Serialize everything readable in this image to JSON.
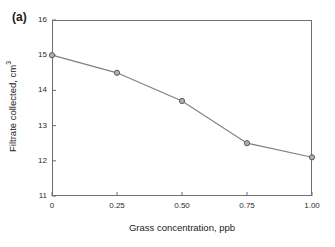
{
  "panel": {
    "label": "(a)"
  },
  "chart_data": {
    "type": "line",
    "title": "",
    "panel_label": "(a)",
    "xlabel": "Grass concentration, ppb",
    "ylabel": "Filtrate collected, cm3",
    "ylabel_base": "Filtrate collected, cm",
    "ylabel_sup": "3",
    "x": [
      0,
      0.25,
      0.5,
      0.75,
      1.0
    ],
    "values": [
      15.0,
      14.5,
      13.7,
      12.5,
      12.1
    ],
    "xlim": [
      0,
      1.0
    ],
    "ylim": [
      11,
      16
    ],
    "xticks": [
      0,
      0.25,
      0.5,
      0.75,
      1.0
    ],
    "xtick_labels": [
      "0",
      "0.25",
      "0.50",
      "0.75",
      "1.00"
    ],
    "yticks": [
      11,
      12,
      13,
      14,
      15,
      16
    ],
    "ytick_labels": [
      "11",
      "12",
      "13",
      "14",
      "15",
      "16"
    ],
    "grid": false,
    "legend": "none",
    "series": [
      {
        "name": "Filtrate collected",
        "values": [
          15.0,
          14.5,
          13.7,
          12.5,
          12.1
        ],
        "line_color": "#808080",
        "marker": "circle",
        "marker_face_color": "#b0b0b0",
        "marker_edge_color": "#595959"
      }
    ],
    "colors": {
      "line": "#808080",
      "axis": "#6e6e6e",
      "text": "#1a1a1a",
      "background": "#ffffff"
    }
  }
}
